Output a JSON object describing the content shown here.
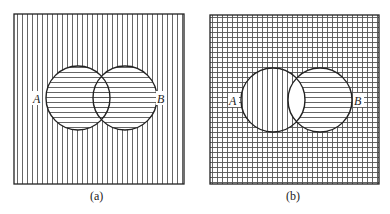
{
  "panels": [
    {
      "caption": "(a)",
      "set_a_label": "A",
      "set_b_label": "B",
      "regions": {
        "outside": "vertical-lines",
        "a_only": "horizontal-lines",
        "b_only": "horizontal-lines",
        "intersection": "horizontal-lines"
      }
    },
    {
      "caption": "(b)",
      "set_a_label": "A",
      "set_b_label": "B",
      "regions": {
        "outside": "grid",
        "a_only": "vertical-lines",
        "b_only": "horizontal-lines",
        "intersection": "blank"
      }
    }
  ],
  "colors": {
    "line": "#222222",
    "hatch": "#555555",
    "background": "#ffffff"
  }
}
